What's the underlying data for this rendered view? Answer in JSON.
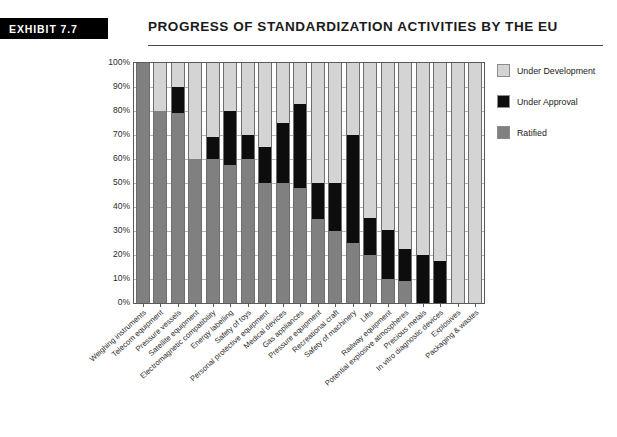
{
  "header": {
    "badge": "EXHIBIT 7.7",
    "title": "PROGRESS OF STANDARDIZATION ACTIVITIES BY THE EU"
  },
  "legend": {
    "position": "right",
    "items": [
      {
        "label": "Under Development",
        "color": "#d4d4d4"
      },
      {
        "label": "Under Approval",
        "color": "#0d0d0d"
      },
      {
        "label": "Ratified",
        "color": "#808080"
      }
    ]
  },
  "chart_data": {
    "type": "bar",
    "stacked": true,
    "title": "PROGRESS OF STANDARDIZATION ACTIVITIES BY THE EU",
    "xlabel": "",
    "ylabel": "",
    "ylim": [
      0,
      100
    ],
    "grid": true,
    "ytick_labels": [
      "0%",
      "10%",
      "20%",
      "30%",
      "40%",
      "50%",
      "60%",
      "70%",
      "80%",
      "90%",
      "100%"
    ],
    "ytick_values": [
      0,
      10,
      20,
      30,
      40,
      50,
      60,
      70,
      80,
      90,
      100
    ],
    "categories": [
      "Weighing instruments",
      "Telecom equipment",
      "Pressure vessels",
      "Satellite equipment",
      "Electromagnetic compatibility",
      "Energy labelling",
      "Safety of toys",
      "Personal protective equipment",
      "Medical devices",
      "Gas appliances",
      "Pressure equipment",
      "Recreational craft",
      "Safety of machinery",
      "Lifts",
      "Railway equipment",
      "Potential explosive atmospheres",
      "Precious metals",
      "In vitro diagnostic devices",
      "Explosives",
      "Packaging & wastes"
    ],
    "series": [
      {
        "name": "Ratified",
        "color": "#808080",
        "values": [
          100,
          80,
          79,
          60,
          60,
          57.5,
          60,
          50,
          50,
          48,
          35,
          30,
          25,
          20,
          10,
          9,
          0,
          0,
          0,
          0
        ]
      },
      {
        "name": "Under Approval",
        "color": "#0d0d0d",
        "values": [
          0,
          0,
          11,
          0,
          9,
          22.5,
          10,
          15,
          25,
          35,
          15,
          20,
          45,
          15.5,
          20.5,
          13.5,
          20,
          17.5,
          0,
          0
        ]
      },
      {
        "name": "Under Development",
        "color": "#d4d4d4",
        "values": [
          0,
          20,
          10,
          40,
          31,
          20,
          30,
          35,
          25,
          17,
          50,
          50,
          30,
          64.5,
          69.5,
          77.5,
          80,
          82.5,
          100,
          100
        ]
      }
    ]
  }
}
